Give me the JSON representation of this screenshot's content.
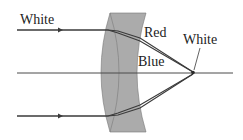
{
  "diagram": {
    "labels": {
      "incoming": "White",
      "red": "Red",
      "blue": "Blue",
      "focus": "White"
    },
    "colors": {
      "lens_fill": "#a9a9a9",
      "lens_overlap_fill": "#9a9a9a",
      "ray": "#3a3a3a",
      "axis": "#4a4a4a",
      "text": "#222222"
    }
  }
}
